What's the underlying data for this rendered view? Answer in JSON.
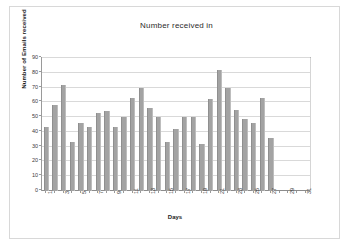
{
  "page": {
    "background_color": "#ffffff",
    "frame_color": "#d8d8d8"
  },
  "chart_data": {
    "type": "bar",
    "title": "Number received in",
    "subtitle": "",
    "xlabel": "Days",
    "ylabel": "Number of Emails received",
    "ylim": [
      0,
      90
    ],
    "ytick_step": 10,
    "yticks": [
      0,
      10,
      20,
      30,
      40,
      50,
      60,
      70,
      80,
      90
    ],
    "grid": true,
    "legend": "none",
    "bar_color": "#a3a3a3",
    "categories": [
      "1",
      "2",
      "3",
      "4",
      "5",
      "6",
      "7",
      "8",
      "9",
      "10",
      "11",
      "12",
      "13",
      "14",
      "15",
      "16",
      "17",
      "18",
      "19",
      "20",
      "21",
      "22",
      "23",
      "24",
      "25",
      "26",
      "27",
      "28",
      "29",
      "30",
      "31"
    ],
    "xtick_labels_shown": [
      "1",
      "3",
      "5",
      "7",
      "9",
      "11",
      "13",
      "15",
      "17",
      "19",
      "21",
      "23",
      "25",
      "27",
      "29",
      "31"
    ],
    "values": [
      43,
      58,
      72,
      33,
      46,
      43,
      53,
      54,
      43,
      50,
      63,
      70,
      56,
      50,
      33,
      42,
      50,
      50,
      32,
      62,
      82,
      70,
      55,
      49,
      46,
      63,
      36,
      0,
      0,
      0,
      0
    ],
    "annotations": [
      {
        "type": "hline",
        "label": "target line",
        "value": 50,
        "color": "#000000"
      }
    ]
  }
}
